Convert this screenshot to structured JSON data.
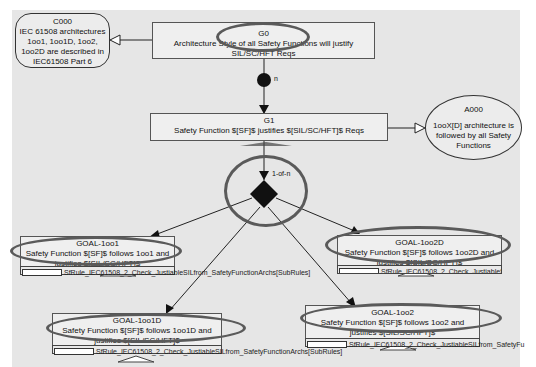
{
  "diagram": {
    "type": "GSN safety argument",
    "nodes": {
      "c000": {
        "id": "C000",
        "text": "IEC 61508 architectures 1oo1, 1oo1D, 1oo2, 1oo2D are described in IEC61508 Part 6",
        "kind": "context"
      },
      "g0": {
        "id": "G0",
        "text": "Architecture Style of all Safety Functions will justify SIL/SC/HFT Reqs",
        "kind": "goal"
      },
      "g1": {
        "id": "G1",
        "text": "Safety Function $[SF]$ justifies $[SIL/SC/HFT]$ Reqs",
        "kind": "goal"
      },
      "a000": {
        "id": "A000",
        "text": "1ooX[D] architecture is followed by all Safety Functions",
        "kind": "assumption"
      },
      "goal_1oo1": {
        "id": "GOAL-1oo1",
        "text": "Safety Function $[SF]$ follows 1oo1 and justifies $[SIL/SC/HFT]$",
        "sub": "SfRule_IEC61508_2_Check_JustiableSILfrom_SafetyFunctionArchs[SubRules]"
      },
      "goal_1oo2d": {
        "id": "GOAL-1oo2D",
        "text": "Safety Function $[SF]$ follows 1oo2D and justifies $[SIL/SC/HFT]$",
        "sub": "SfRule_IEC61508_2_Check_JustiableSILfrom_S"
      },
      "goal_1oo1d": {
        "id": "GOAL-1oo1D",
        "text": "Safety Function $[SF]$ follows 1oo1D and justifies $[SIL/SC/HFT]$",
        "sub": "SfRule_IEC61508_2_Check_JustiableSILfrom_SafetyFunctionArchs[SubRules]"
      },
      "goal_1oo2": {
        "id": "GOAL-1oo2",
        "text": "Safety Function $[SF]$ follows 1oo2 and justifies $[SIL/SC/HFT]$",
        "sub": "SfRule_IEC61508_2_Check_JustiableSILfrom_SafetyFu"
      }
    },
    "connectors": {
      "multiplicity_label": "n",
      "choice_label": "1-of-n"
    },
    "colors": {
      "background": "#e6e6e6",
      "node_fill": "#efefef",
      "line": "#222222",
      "highlight": "#5a5a5a"
    }
  }
}
